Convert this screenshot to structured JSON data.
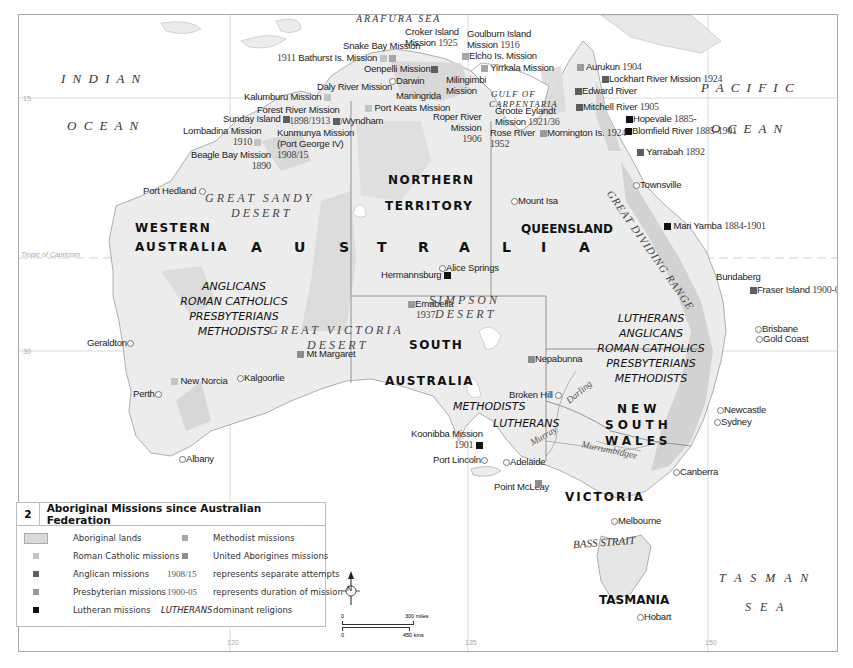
{
  "colors": {
    "roman_catholic": "#c4c4c4",
    "anglican": "#5e5e5e",
    "presbyterian": "#9a9a9a",
    "lutheran": "#111111",
    "methodist": "#a6a6a6",
    "united_aborigines": "#8c8c8c",
    "aboriginal_lands": "#d9d9d9",
    "land": "#ececec",
    "frame": "#a8a8a8"
  },
  "seas": {
    "indian_1": "I N D I A N",
    "indian_2": "O C E A N",
    "pacific_1": "P A C I F I C",
    "pacific_2": "O C E A N",
    "arafura": "ARAFURA SEA",
    "gulf_1": "GULF OF",
    "gulf_2": "CARPENTARIA",
    "tasman_1": "T A S M A N",
    "tasman_2": "S E A",
    "bass": "BASS STRAIT"
  },
  "regions": {
    "wa_1": "WESTERN",
    "wa_2": "AUSTRALIA",
    "nt_1": "NORTHERN",
    "nt_2": "TERRITORY",
    "qld": "QUEENSLAND",
    "sa_1": "SOUTH",
    "sa_2": "AUSTRALIA",
    "nsw_1": "NEW",
    "nsw_2": "SOUTH",
    "nsw_3": "WALES",
    "vic": "VICTORIA",
    "tas": "TASMANIA",
    "australia_letters": [
      "A",
      "U",
      "S",
      "T",
      "R",
      "A",
      "L",
      "I",
      "A"
    ]
  },
  "deserts": {
    "great_sandy_1": "GREAT SANDY",
    "great_sandy_2": "DESERT",
    "great_victoria_1": "GREAT VICTORIA",
    "great_victoria_2": "DESERT",
    "simpson_1": "SIMPSON",
    "simpson_2": "DESERT",
    "range": "GREAT DIVIDING RANGE"
  },
  "rivers": {
    "darling": "Darling",
    "murray": "Murray",
    "murrumbidgee": "Murrumbidgee"
  },
  "religions": {
    "wa": [
      "ANGLICANS",
      "ROMAN CATHOLICS",
      "PRESBYTERIANS",
      "METHODISTS"
    ],
    "east": [
      "LUTHERANS",
      "ANGLICANS",
      "ROMAN CATHOLICS",
      "PRESBYTERIANS",
      "METHODISTS"
    ],
    "sa": [
      "METHODISTS",
      "LUTHERANS"
    ]
  },
  "cities": {
    "port_hedland": "Port Hedland",
    "geraldton": "Geraldton",
    "perth": "Perth",
    "albany": "Albany",
    "kalgoorlie": "Kalgoorlie",
    "darwin": "Darwin",
    "wyndham": "Wyndham",
    "alice_springs": "Alice Springs",
    "mount_isa": "Mount Isa",
    "townsville": "Townsville",
    "bundaberg": "Bundaberg",
    "brisbane": "Brisbane",
    "gold_coast": "Gold Coast",
    "newcastle": "Newcastle",
    "sydney": "Sydney",
    "canberra": "Canberra",
    "melbourne": "Melbourne",
    "hobart": "Hobart",
    "adelaide": "Adelaide",
    "port_lincoln": "Port Lincoln",
    "broken_hill": "Broken Hill",
    "maningrida": "Maningrida"
  },
  "missions": {
    "snake_bay": {
      "name": "Snake Bay Mission"
    },
    "bathurst": {
      "name": "Bathurst Is. Mission",
      "year": "1911"
    },
    "croker_1": {
      "name": "Croker Island"
    },
    "croker_2": {
      "name": "Mission",
      "year": "1925"
    },
    "goulburn_1": {
      "name": "Goulburn Island"
    },
    "goulburn_2": {
      "name": "Mission",
      "year": "1916"
    },
    "elcho": {
      "name": "Elcho Is. Mission"
    },
    "yirrkala": {
      "name": "Yirrkala Mission"
    },
    "oenpelli": {
      "name": "Oenpelli Mission"
    },
    "milingimbi_1": {
      "name": "Milingimbi"
    },
    "milingimbi_2": {
      "name": "Mission"
    },
    "daly_river": {
      "name": "Daly River Mission"
    },
    "kalumburu": {
      "name": "Kalumburu Mission"
    },
    "port_keats": {
      "name": "Port Keats Mission"
    },
    "forest_river": {
      "name": "Forest River Mission",
      "year": "1898/1913"
    },
    "sunday_island": {
      "name": "Sunday Island"
    },
    "lombadina": {
      "name": "Lombadina Mission",
      "year": "1910"
    },
    "kunmunya_1": {
      "name": "Kunmunya Mission"
    },
    "kunmunya_2": {
      "name": "(Port George IV)"
    },
    "kunmunya_3": {
      "year": "1908/15"
    },
    "beagle_bay": {
      "name": "Beagle Bay Mission",
      "year": "1890"
    },
    "roper_river_1": {
      "name": "Roper River"
    },
    "roper_river_2": {
      "name": "Mission"
    },
    "roper_river_3": {
      "year": "1906"
    },
    "groote_1": {
      "name": "Groote Eylandt"
    },
    "groote_2": {
      "name": "Mission",
      "year": "1921/36"
    },
    "rose_river": {
      "name": "Rose River",
      "year": "1952"
    },
    "aurukun": {
      "name": "Aurukun",
      "year": "1904"
    },
    "lockhart": {
      "name": "Lockhart River Mission",
      "year": "1924"
    },
    "edward_river": {
      "name": "Edward River"
    },
    "mitchell_river": {
      "name": "Mitchell River",
      "year": "1905"
    },
    "hopevale": {
      "name": "Hopevale",
      "year": "1885-"
    },
    "blomfield": {
      "name": "Blomfield River",
      "year": "1885-1901"
    },
    "mornington": {
      "name": "Mornington Is.",
      "year": "1924"
    },
    "yarrabah": {
      "name": "Yarrabah",
      "year": "1892"
    },
    "mari_yamba": {
      "name": "Mari Yamba",
      "year": "1884-1901"
    },
    "fraser_island": {
      "name": "Fraser Island",
      "year": "1900-05"
    },
    "hermannsburg": {
      "name": "Hermannsburg"
    },
    "ernabella": {
      "name": "Ernabella",
      "year": "1937"
    },
    "mt_margaret": {
      "name": "Mt Margaret"
    },
    "new_norcia": {
      "name": "New Norcia"
    },
    "nepabunna": {
      "name": "Nepabunna"
    },
    "koonibba": {
      "name": "Koonibba Mission",
      "year": "1901"
    },
    "point_mcleay": {
      "name": "Point McLeay"
    }
  },
  "grid": {
    "lat_15": "15",
    "lat_30": "30",
    "tropic": "Tropic of Capricorn",
    "lon_120": "120",
    "lon_135": "135",
    "lon_150": "150"
  },
  "compass": {
    "label": "N"
  },
  "scale": {
    "miles_zero": "0",
    "miles_max": "300 miles",
    "kms_zero": "0",
    "kms_max": "450 kms"
  },
  "legend": {
    "number": "2",
    "title": "Aboriginal Missions since Australian Federation",
    "items": [
      {
        "label": "Aboriginal lands"
      },
      {
        "label": "Roman Catholic missions"
      },
      {
        "label": "Anglican missions"
      },
      {
        "label": "Presbyterian missions"
      },
      {
        "label": "Lutheran missions"
      },
      {
        "label": "Methodist missions"
      },
      {
        "label": "United Aborigines missions"
      }
    ],
    "notes": [
      {
        "sample": "1908/15",
        "label": "represents separate attempts"
      },
      {
        "sample": "1900-05",
        "label": "represents duration of mission"
      },
      {
        "sample": "LUTHERANS",
        "label": "dominant religions"
      }
    ]
  }
}
